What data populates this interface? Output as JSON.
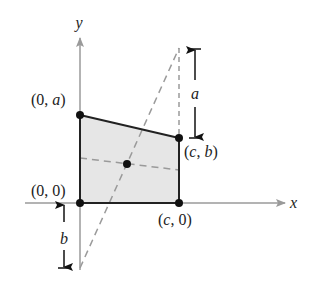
{
  "diagram": {
    "type": "geometry-figure",
    "axes": {
      "x_label": "x",
      "y_label": "y"
    },
    "points": [
      {
        "id": "origin",
        "label_parts": [
          "(0, 0)"
        ],
        "text": "(0, 0)"
      },
      {
        "id": "top_left",
        "text_open": "(0, ",
        "text_var": "a",
        "text_close": ")"
      },
      {
        "id": "top_right",
        "text_open": "(",
        "text_var1": "c",
        "text_sep": ", ",
        "text_var2": "b",
        "text_close": ")"
      },
      {
        "id": "bottom_right",
        "text_open": "(",
        "text_var": "c",
        "text_close": ", 0)"
      }
    ],
    "dimensions": {
      "top_extension_label": "a",
      "bottom_extension_label": "b"
    },
    "colors": {
      "shape_fill": "#e6e6e6",
      "shape_stroke": "#222222",
      "axis": "#9a9a9a",
      "dashed": "#9a9a9a",
      "point": "#111111"
    }
  }
}
